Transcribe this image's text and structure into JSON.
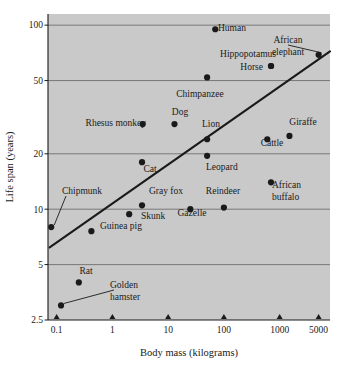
{
  "chart_data": {
    "type": "scatter",
    "title": "",
    "subtitle": "",
    "xlabel": "Body mass (kilograms)",
    "ylabel": "Life span (years)",
    "xscale": "log",
    "yscale": "log",
    "xlim": [
      0.07,
      8000
    ],
    "ylim": [
      2.5,
      115
    ],
    "xticks": [
      0.1,
      1,
      10,
      100,
      1000,
      5000
    ],
    "xtick_labels": [
      "0.1",
      "1",
      "10",
      "100",
      "1000",
      "5000"
    ],
    "yticks": [
      2.5,
      5,
      10,
      20,
      50,
      100
    ],
    "ytick_labels": [
      "2.5",
      "5",
      "10",
      "20",
      "50",
      "100"
    ],
    "grid": "horizontal",
    "legend": "none",
    "plot_background": "#c9c9c9",
    "point_color": "#1a1a1a",
    "line_color": "#1a1a1a",
    "points": [
      {
        "name": "Golden hamster",
        "x": 0.12,
        "y": 3.0,
        "label_pos": "leader",
        "label_x": 110,
        "label_y": 288,
        "label_align": "start",
        "label_lines": [
          "Golden",
          "hamster"
        ],
        "leader": true
      },
      {
        "name": "Rat",
        "x": 0.25,
        "y": 4.0,
        "label_pos": "above",
        "label_x": 86,
        "label_y": 274,
        "label_align": "middle",
        "label_lines": [
          "Rat"
        ],
        "leader": false
      },
      {
        "name": "Chipmunk",
        "x": 0.08,
        "y": 8.0,
        "label_pos": "leader",
        "label_x": 62,
        "label_y": 194,
        "label_align": "start",
        "label_lines": [
          "Chipmunk"
        ],
        "leader": true
      },
      {
        "name": "Guinea pig",
        "x": 0.42,
        "y": 7.6,
        "label_pos": "right",
        "label_x": 100,
        "label_y": 229,
        "label_align": "start",
        "label_lines": [
          "Guinea pig"
        ],
        "leader": false
      },
      {
        "name": "Skunk",
        "x": 2.0,
        "y": 9.4,
        "label_pos": "right",
        "label_x": 141,
        "label_y": 219,
        "label_align": "start",
        "label_lines": [
          "Skunk"
        ],
        "leader": false
      },
      {
        "name": "Gray fox",
        "x": 3.4,
        "y": 10.5,
        "label_pos": "right",
        "label_x": 149,
        "label_y": 194,
        "label_align": "start",
        "label_lines": [
          "Gray fox"
        ],
        "leader": false
      },
      {
        "name": "Cat",
        "x": 3.4,
        "y": 18.0,
        "label_pos": "below",
        "label_x": 150,
        "label_y": 172,
        "label_align": "middle",
        "label_lines": [
          "Cat"
        ],
        "leader": false
      },
      {
        "name": "Dog",
        "x": 13,
        "y": 29.0,
        "label_pos": "above",
        "label_x": 180,
        "label_y": 115,
        "label_align": "middle",
        "label_lines": [
          "Dog"
        ],
        "leader": false
      },
      {
        "name": "Rhesus monkey",
        "x": 3.5,
        "y": 29.0,
        "label_pos": "left",
        "label_x": 146,
        "label_y": 126,
        "label_align": "end",
        "label_lines": [
          "Rhesus monkey"
        ],
        "leader": false
      },
      {
        "name": "Gazelle",
        "x": 25,
        "y": 10.0,
        "label_pos": "below",
        "label_x": 192,
        "label_y": 216,
        "label_align": "middle",
        "label_lines": [
          "Gazelle"
        ],
        "leader": false
      },
      {
        "name": "Reindeer",
        "x": 100,
        "y": 10.2,
        "label_pos": "above",
        "label_x": 223,
        "label_y": 194,
        "label_align": "middle",
        "label_lines": [
          "Reindeer"
        ],
        "leader": false
      },
      {
        "name": "Leopard",
        "x": 50,
        "y": 19.5,
        "label_pos": "below",
        "label_x": 206,
        "label_y": 170,
        "label_align": "start",
        "label_lines": [
          "Leopard"
        ],
        "leader": false
      },
      {
        "name": "Lion",
        "x": 50,
        "y": 24.0,
        "label_pos": "above",
        "label_x": 211,
        "label_y": 127,
        "label_align": "middle",
        "label_lines": [
          "Lion"
        ],
        "leader": false
      },
      {
        "name": "Chimpanzee",
        "x": 50,
        "y": 52.0,
        "label_pos": "below",
        "label_x": 200,
        "label_y": 97,
        "label_align": "middle",
        "label_lines": [
          "Chimpanzee"
        ],
        "leader": false
      },
      {
        "name": "Human",
        "x": 70,
        "y": 95.0,
        "label_pos": "right",
        "label_x": 218,
        "label_y": 31,
        "label_align": "start",
        "label_lines": [
          "Human"
        ],
        "leader": false
      },
      {
        "name": "Hippopotamus",
        "x": 700,
        "y": 60.0,
        "label_pos": "left",
        "label_x": 276,
        "label_y": 57,
        "label_align": "end",
        "label_lines": [
          "Hippopotamus"
        ],
        "leader": false
      },
      {
        "name": "Horse",
        "x": 700,
        "y": 60.0,
        "label_pos": "left",
        "label_x": 263,
        "label_y": 70,
        "label_align": "end",
        "label_lines": [
          "Horse"
        ],
        "leader": false
      },
      {
        "name": "African elephant",
        "x": 5000,
        "y": 69.0,
        "label_pos": "leader",
        "label_x": 288,
        "label_y": 43,
        "label_align": "middle",
        "label_lines": [
          "African",
          "elephant"
        ],
        "leader": true
      },
      {
        "name": "Cattle",
        "x": 600,
        "y": 24.0,
        "label_pos": "below",
        "label_x": 272,
        "label_y": 146,
        "label_align": "middle",
        "label_lines": [
          "Cattle"
        ],
        "leader": false
      },
      {
        "name": "Giraffe",
        "x": 1500,
        "y": 25.0,
        "label_pos": "above",
        "label_x": 303,
        "label_y": 125,
        "label_align": "middle",
        "label_lines": [
          "Giraffe"
        ],
        "leader": false
      },
      {
        "name": "African buffalo",
        "x": 700,
        "y": 14.0,
        "label_pos": "right",
        "label_x": 272,
        "label_y": 188,
        "label_align": "start",
        "label_lines": [
          "African",
          "buffalo"
        ],
        "leader": false
      }
    ],
    "trend_line": {
      "name": "regression-line",
      "x1": 0.075,
      "y1": 6.2,
      "x2": 8000,
      "y2": 72.0,
      "description": "least-squares fit through log-log data"
    },
    "annotations": []
  }
}
